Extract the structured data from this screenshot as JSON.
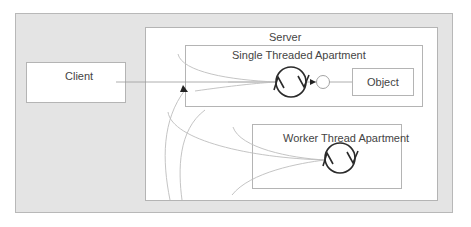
{
  "diagram": {
    "type": "COM apartment threading diagram",
    "client": {
      "label": "Client"
    },
    "server": {
      "label": "Server",
      "sta": {
        "label": "Single Threaded Apartment",
        "object_label": "Object"
      },
      "wta": {
        "label": "Worker Thread Apartment"
      }
    },
    "colors": {
      "panel_bg": "#e4e4e4",
      "box_bg": "#ffffff",
      "box_border": "#b4b4b4",
      "line": "#9a9a9a",
      "curve": "#bdbdbd",
      "loop": "#2a2a2a",
      "text": "#444444"
    }
  }
}
